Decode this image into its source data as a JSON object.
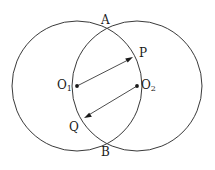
{
  "figure": {
    "kind": "geometry-diagram",
    "background_color": "#ffffff",
    "stroke_color": "#3a3a3a",
    "label_color": "#1a1a1a"
  },
  "labels": {
    "a": "A",
    "b": "B",
    "p": "P",
    "q": "Q",
    "o1_base": "O",
    "o1_sub": "1",
    "o2_base": "O",
    "o2_sub": "2"
  },
  "geometry": {
    "circles": [
      {
        "name": "left-circle",
        "cx": 77,
        "cy": 86,
        "r": 65
      },
      {
        "name": "right-circle",
        "cx": 137,
        "cy": 86,
        "r": 65
      }
    ],
    "points": [
      {
        "name": "A",
        "x": 107,
        "y": 30
      },
      {
        "name": "B",
        "x": 107,
        "y": 142
      },
      {
        "name": "P",
        "x": 133,
        "y": 57
      },
      {
        "name": "Q",
        "x": 84,
        "y": 118
      },
      {
        "name": "O1",
        "x": 77,
        "y": 86
      },
      {
        "name": "O2",
        "x": 137,
        "y": 86
      }
    ],
    "vectors": [
      {
        "name": "O1-to-P",
        "from": "O1",
        "to": "P"
      },
      {
        "name": "O2-to-Q",
        "from": "O2",
        "to": "Q"
      }
    ]
  }
}
